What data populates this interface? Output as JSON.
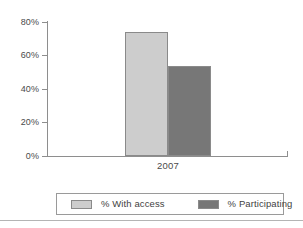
{
  "chart_data": {
    "type": "bar",
    "title": "",
    "subtitle": "",
    "xlabel": "",
    "ylabel": "",
    "categories": [
      "2007"
    ],
    "series": [
      {
        "name": "% With access",
        "values": [
          74
        ],
        "color": "#cdcdcd"
      },
      {
        "name": "% Participating",
        "values": [
          54
        ],
        "color": "#777777"
      }
    ],
    "ylim": [
      0,
      80
    ],
    "y_ticks": [
      0,
      20,
      40,
      60,
      80
    ],
    "y_tick_labels": [
      "0%",
      "20%",
      "40%",
      "60%",
      "80%"
    ],
    "grid": false,
    "legend_position": "bottom"
  },
  "axes": {
    "y_tick_labels": [
      "80%",
      "60%",
      "40%",
      "20%",
      "0%"
    ],
    "x_tick_labels": [
      "2007"
    ]
  },
  "legend": {
    "entries": [
      {
        "label": "% With access",
        "color": "#cdcdcd"
      },
      {
        "label": "% Participating",
        "color": "#777777"
      }
    ]
  },
  "colors": {
    "series_light": "#cdcdcd",
    "series_dark": "#777777",
    "axis": "#8e8e8e",
    "border": "#8a8a8a",
    "text": "#3f3f3f",
    "footer_rule": "#b4b4b4",
    "background": "#ffffff"
  }
}
